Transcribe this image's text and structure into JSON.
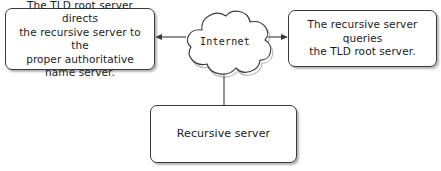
{
  "diagram": {
    "nodes": {
      "tld_directs": {
        "label": "The TLD root server directs\nthe recursive server to the\nproper authoritative\nname server.",
        "shape": "rounded-rectangle"
      },
      "recursive_queries": {
        "label": "The recursive server queries\nthe TLD root server.",
        "shape": "rounded-rectangle"
      },
      "internet": {
        "label": "Internet",
        "shape": "cloud"
      },
      "recursive_server": {
        "label": "Recursive server",
        "shape": "rounded-rectangle"
      }
    },
    "connectors": [
      {
        "name": "cloud-to-tld-directs",
        "from": "internet",
        "to": "tld_directs",
        "direction": "left",
        "arrowhead": true
      },
      {
        "name": "cloud-to-recursive-queries",
        "from": "internet",
        "to": "recursive_queries",
        "direction": "right",
        "arrowhead": true
      },
      {
        "name": "cloud-to-recursive-server",
        "from": "internet",
        "to": "recursive_server",
        "direction": "down",
        "arrowhead": false
      }
    ],
    "colors": {
      "stroke": "#3a3a3a",
      "text": "#1b1b1b",
      "background": "#ffffff",
      "shadow": "#787878"
    }
  }
}
